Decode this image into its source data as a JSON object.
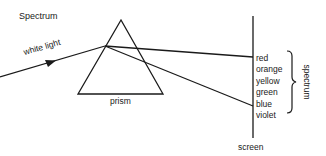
{
  "diagram": {
    "title": "Spectrum",
    "labels": {
      "incident": "white light",
      "prism": "prism",
      "screen": "screen",
      "spectrum": "spectrum"
    },
    "colors": [
      "red",
      "orange",
      "yellow",
      "green",
      "blue",
      "violet"
    ],
    "line_color": "#1a1a1a"
  }
}
